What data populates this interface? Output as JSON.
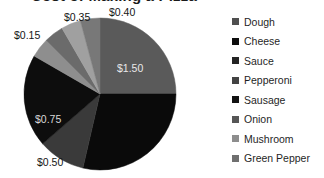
{
  "chart_data": {
    "type": "pie",
    "title": "Cost of Making a Pizza",
    "title_clipped": true,
    "xlabel": "",
    "ylabel": "",
    "legend_position": "right",
    "grid": false,
    "value_prefix": "$",
    "categories": [
      "Dough",
      "Cheese",
      "Sauce",
      "Pepperoni",
      "Sausage",
      "Onion",
      "Mushroom",
      "Green Pepper"
    ],
    "values": [
      1.5,
      0.5,
      0.75,
      0.15,
      0.35,
      0.4,
      0.2,
      0.15
    ],
    "labels": [
      "$1.50",
      "$0.50",
      "$0.75",
      "$0.15",
      "$0.35",
      "$0.40",
      "",
      ""
    ],
    "colors": [
      "#5a5a5a",
      "#0a0a0a",
      "#3a3a3a",
      "#0d0d0d",
      "#2b2b2b",
      "#6b6b6b",
      "#8e8e8e",
      "#787878"
    ],
    "start_angle": 0,
    "direction": "clockwise",
    "slices": [
      {
        "name": "Dough",
        "value": 1.5,
        "label": "$1.50",
        "color": "#5a5a5a",
        "start": 0,
        "end": 90,
        "label_pos": "inside"
      },
      {
        "name": "Cheese",
        "value": 0.5,
        "label": "$0.50",
        "color": "#0a0a0a",
        "start": 90,
        "end": 193,
        "label_pos": "outside"
      },
      {
        "name": "Sauce",
        "value": 0.75,
        "label": "$0.75",
        "color": "#3a3a3a",
        "start": 193,
        "end": 229,
        "label_pos": "inside"
      },
      {
        "name": "Pepperoni",
        "value": 0.15,
        "label": "$0.15",
        "color": "#0d0d0d",
        "start": 229,
        "end": 300,
        "label_pos": "outside"
      },
      {
        "name": "Sausage",
        "value": 0.35,
        "label": "$0.35",
        "color": "#8e8e8e",
        "start": 300,
        "end": 315,
        "label_pos": "outside"
      },
      {
        "name": "Onion",
        "value": 0.4,
        "label": "$0.40",
        "color": "#6b6b6b",
        "start": 315,
        "end": 330,
        "label_pos": "outside"
      },
      {
        "name": "Mushroom",
        "value": 0.2,
        "label": "",
        "color": "#a0a0a0",
        "start": 330,
        "end": 345,
        "label_pos": "none"
      },
      {
        "name": "Green Pepper",
        "value": 0.15,
        "label": "",
        "color": "#787878",
        "start": 345,
        "end": 360,
        "label_pos": "none"
      }
    ],
    "data_labels": [
      {
        "text": "$0.35"
      },
      {
        "text": "$0.40"
      },
      {
        "text": "$0.15"
      },
      {
        "text": "$1.50"
      },
      {
        "text": "$0.75"
      },
      {
        "text": "$0.50"
      }
    ]
  },
  "legend": {
    "items": [
      {
        "label": "Dough",
        "color": "#4f4f4f"
      },
      {
        "label": "Cheese",
        "color": "#0d0d0d"
      },
      {
        "label": "Sauce",
        "color": "#242424"
      },
      {
        "label": "Pepperoni",
        "color": "#434343"
      },
      {
        "label": "Sausage",
        "color": "#121212"
      },
      {
        "label": "Onion",
        "color": "#565656"
      },
      {
        "label": "Mushroom",
        "color": "#8d8d8d"
      },
      {
        "label": "Green Pepper",
        "color": "#6f6f6f"
      }
    ]
  }
}
